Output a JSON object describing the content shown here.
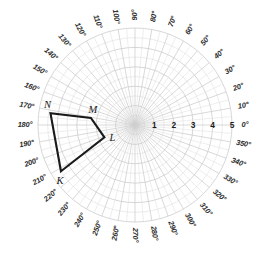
{
  "chart_data": {
    "type": "scatter",
    "title": "",
    "subtitle": "",
    "projection": "polar",
    "grid": true,
    "legend_position": "none",
    "angle_unit": "degrees",
    "angle_direction": "counterclockwise",
    "angle_zero_at": "east",
    "radial_axis": {
      "label": "",
      "ticks": [
        1,
        2,
        3,
        4,
        5
      ],
      "tick_labels": [
        "1",
        "2",
        "3",
        "4",
        "5"
      ],
      "rlim": [
        0,
        5
      ],
      "tick_angle_deg": 0
    },
    "angular_axis": {
      "tick_step_deg": 10,
      "tick_labels": [
        "0°",
        "10°",
        "20°",
        "30°",
        "40°",
        "50°",
        "60°",
        "70°",
        "80°",
        "90°",
        "100°",
        "110°",
        "120°",
        "130°",
        "140°",
        "150°",
        "160°",
        "170°",
        "180°",
        "190°",
        "200°",
        "210°",
        "220°",
        "230°",
        "240°",
        "250°",
        "260°",
        "270°",
        "280°",
        "290°",
        "300°",
        "310°",
        "320°",
        "330°",
        "340°",
        "350°"
      ]
    },
    "series": [
      {
        "name": "KLMN",
        "type": "polygon",
        "closed": true,
        "color": "#1a1a1a",
        "points": [
          {
            "label": "K",
            "theta_deg": 212,
            "r": 4.5
          },
          {
            "label": "L",
            "theta_deg": 202,
            "r": 1.7
          },
          {
            "label": "M",
            "theta_deg": 171,
            "r": 2.3
          },
          {
            "label": "N",
            "theta_deg": 172,
            "r": 4.4
          }
        ]
      }
    ],
    "annotations": [
      {
        "text": "K",
        "theta_deg": 212,
        "r": 4.5
      },
      {
        "text": "L",
        "theta_deg": 202,
        "r": 1.7
      },
      {
        "text": "M",
        "theta_deg": 171,
        "r": 2.3
      },
      {
        "text": "N",
        "theta_deg": 172,
        "r": 4.4
      }
    ]
  },
  "colors": {
    "background": "#ffffff",
    "grid": "#c9c9c9",
    "grid_minor": "#d9d9d9",
    "shape_stroke": "#1a1a1a",
    "text": "#2b2b2b"
  },
  "geometry": {
    "center_x": 135,
    "center_y": 125,
    "pixels_per_unit": 19.4,
    "outer_radius_px": 97,
    "label_radius_px": 110
  }
}
